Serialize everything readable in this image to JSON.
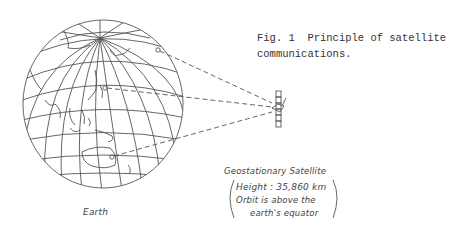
{
  "figure": {
    "caption_line1": "Fig. 1  Principle of satellite",
    "caption_line2": "communications."
  },
  "earth": {
    "label": "Earth",
    "icon": "globe-icon"
  },
  "satellite": {
    "title": "Geostationary Satellite",
    "height_line": "Height : 35,860 km",
    "orbit_line1": "Orbit is above the",
    "orbit_line2": "earth's equator",
    "icon": "satellite-icon"
  },
  "colors": {
    "line": "#555555",
    "text": "#333333",
    "background": "#ffffff"
  }
}
